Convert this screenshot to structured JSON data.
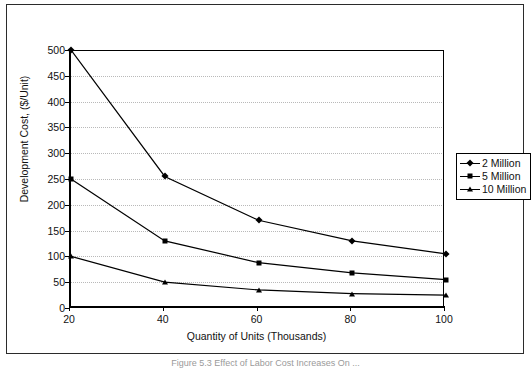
{
  "figure": {
    "caption": "Figure 5.3  Effect of Labor Cost Increases On ..."
  },
  "chart_data": {
    "type": "line",
    "title": "",
    "xlabel": "Quantity of Units (Thousands)",
    "ylabel": "Development Cost, ($/Unit)",
    "x": [
      20,
      40,
      60,
      80,
      100
    ],
    "xtick_labels": [
      "20",
      "40",
      "60",
      "80",
      "100"
    ],
    "xlim": [
      20,
      100
    ],
    "ylim": [
      0,
      500
    ],
    "ytick_labels": [
      "0",
      "50",
      "100",
      "150",
      "200",
      "250",
      "300",
      "350",
      "400",
      "450",
      "500"
    ],
    "yticks": [
      0,
      50,
      100,
      150,
      200,
      250,
      300,
      350,
      400,
      450,
      500
    ],
    "grid": "horizontal-dotted",
    "legend_position": "right",
    "series": [
      {
        "name": "2 Million",
        "marker": "diamond",
        "color": "#000000",
        "values": [
          500,
          255,
          170,
          130,
          105
        ]
      },
      {
        "name": "5 Million",
        "marker": "square",
        "color": "#000000",
        "values": [
          250,
          130,
          88,
          68,
          55
        ]
      },
      {
        "name": "10 Million",
        "marker": "triangle",
        "color": "#000000",
        "values": [
          100,
          50,
          35,
          28,
          25
        ]
      }
    ]
  }
}
